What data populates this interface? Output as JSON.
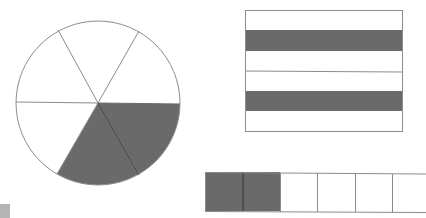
{
  "colors": {
    "shaded": "#6a6a6a",
    "unshaded": "#ffffff",
    "stroke": "#8c8c8c",
    "corner_mark": "#b4b4b4"
  },
  "figures": {
    "circle": {
      "description": "circle divided into 6 equal sectors, 2 shaded",
      "total_parts": 6,
      "shaded_parts": 2
    },
    "rectangle": {
      "description": "rectangle divided into 6 horizontal strips, 2 shaded (2nd and 5th)",
      "total_parts": 6,
      "shaded_indices": [
        1,
        4
      ]
    },
    "strip": {
      "description": "horizontal strip divided into 6 cells, first 2 shaded",
      "total_parts": 6,
      "shaded_parts": 2
    }
  }
}
